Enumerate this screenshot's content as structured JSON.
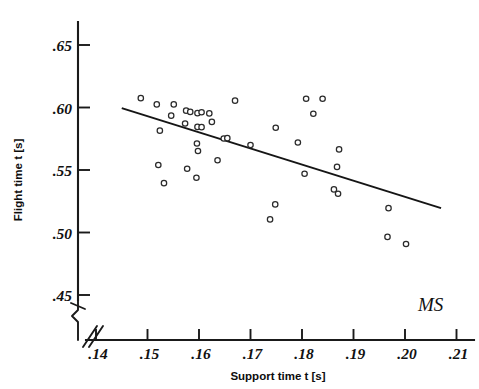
{
  "chart_data": {
    "type": "scatter",
    "title": "",
    "xlabel": "Support time  t [s]",
    "ylabel": "Flight time  t [s]",
    "xlim": [
      0.14,
      0.215
    ],
    "ylim": [
      0.44,
      0.665
    ],
    "grid": false,
    "legend": null,
    "annotation": "MS",
    "axis_break_x": true,
    "axis_break_y": true,
    "xticks": [
      ".14",
      ".15",
      ".16",
      ".17",
      ".18",
      ".19",
      ".20",
      ".21"
    ],
    "xtick_values": [
      0.14,
      0.15,
      0.16,
      0.17,
      0.18,
      0.19,
      0.2,
      0.21
    ],
    "yticks": [
      ".65",
      ".60",
      ".55",
      ".50",
      ".45"
    ],
    "ytick_values": [
      0.65,
      0.6,
      0.55,
      0.5,
      0.45
    ],
    "points": [
      {
        "x": 0.1487,
        "y": 0.6075
      },
      {
        "x": 0.1518,
        "y": 0.6025
      },
      {
        "x": 0.1551,
        "y": 0.6025
      },
      {
        "x": 0.1546,
        "y": 0.5935
      },
      {
        "x": 0.1575,
        "y": 0.5975
      },
      {
        "x": 0.1583,
        "y": 0.5965
      },
      {
        "x": 0.1597,
        "y": 0.5955
      },
      {
        "x": 0.1605,
        "y": 0.5962
      },
      {
        "x": 0.162,
        "y": 0.5953
      },
      {
        "x": 0.1573,
        "y": 0.5872
      },
      {
        "x": 0.1597,
        "y": 0.5845
      },
      {
        "x": 0.1605,
        "y": 0.5843
      },
      {
        "x": 0.1625,
        "y": 0.5885
      },
      {
        "x": 0.1524,
        "y": 0.5815
      },
      {
        "x": 0.1596,
        "y": 0.5712
      },
      {
        "x": 0.1598,
        "y": 0.5652
      },
      {
        "x": 0.1648,
        "y": 0.5752
      },
      {
        "x": 0.1655,
        "y": 0.5755
      },
      {
        "x": 0.17,
        "y": 0.57
      },
      {
        "x": 0.1636,
        "y": 0.5578
      },
      {
        "x": 0.1521,
        "y": 0.554
      },
      {
        "x": 0.1577,
        "y": 0.551
      },
      {
        "x": 0.1595,
        "y": 0.5438
      },
      {
        "x": 0.1532,
        "y": 0.5395
      },
      {
        "x": 0.167,
        "y": 0.6055
      },
      {
        "x": 0.1749,
        "y": 0.5838
      },
      {
        "x": 0.1792,
        "y": 0.572
      },
      {
        "x": 0.1748,
        "y": 0.5225
      },
      {
        "x": 0.1738,
        "y": 0.5105
      },
      {
        "x": 0.1808,
        "y": 0.607
      },
      {
        "x": 0.184,
        "y": 0.607
      },
      {
        "x": 0.1822,
        "y": 0.595
      },
      {
        "x": 0.1805,
        "y": 0.547
      },
      {
        "x": 0.1872,
        "y": 0.5665
      },
      {
        "x": 0.1868,
        "y": 0.5525
      },
      {
        "x": 0.1862,
        "y": 0.5345
      },
      {
        "x": 0.187,
        "y": 0.531
      },
      {
        "x": 0.1968,
        "y": 0.5195
      },
      {
        "x": 0.1966,
        "y": 0.4965
      },
      {
        "x": 0.2002,
        "y": 0.4908
      }
    ],
    "regression_line": {
      "x1": 0.145,
      "y1": 0.5995,
      "x2": 0.207,
      "y2": 0.5195
    }
  }
}
